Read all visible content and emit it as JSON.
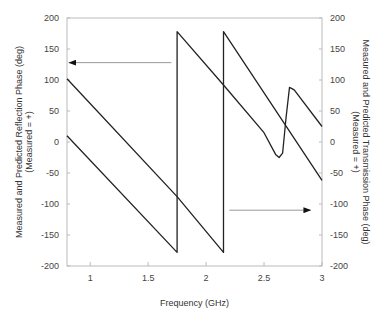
{
  "chart_data": {
    "type": "line",
    "title": "",
    "xlabel": "Frequency (GHz)",
    "ylabel_left": [
      "Measured and Predicted Reflection Phase (deg)",
      "(Measured = +)"
    ],
    "ylabel_right": [
      "Measured and Predicted Transmission Phase (deg)",
      "(Measured = +)"
    ],
    "xlim": [
      0.8,
      3
    ],
    "ylim": [
      -200,
      200
    ],
    "x_ticks": [
      "1",
      "1.5",
      "2",
      "2.5",
      "3"
    ],
    "x_tick_values": [
      1,
      1.5,
      2,
      2.5,
      3
    ],
    "y_ticks": [
      "200",
      "150",
      "100",
      "50",
      "0",
      "-50",
      "-100",
      "-150",
      "-200"
    ],
    "y_tick_values": [
      200,
      150,
      100,
      50,
      0,
      -50,
      -100,
      -150,
      -200
    ],
    "grid": false,
    "series": [
      {
        "name": "Reflection phase",
        "axis": "left",
        "points": [
          [
            0.8,
            10
          ],
          [
            1.75,
            -178
          ],
          [
            1.75,
            178
          ],
          [
            2.15,
            92
          ],
          [
            2.5,
            15
          ],
          [
            2.6,
            -20
          ],
          [
            2.63,
            -25
          ],
          [
            2.66,
            -18
          ],
          [
            2.69,
            40
          ],
          [
            2.72,
            88
          ],
          [
            2.76,
            84
          ],
          [
            3,
            25
          ]
        ]
      },
      {
        "name": "Transmission phase",
        "axis": "right",
        "points": [
          [
            0.8,
            102
          ],
          [
            1.75,
            -88
          ],
          [
            2.15,
            -178
          ],
          [
            2.15,
            178
          ],
          [
            3,
            -62
          ]
        ]
      }
    ],
    "annotations": [
      {
        "type": "arrow",
        "direction": "left",
        "from": [
          1.7,
          128
        ],
        "to": [
          0.82,
          128
        ],
        "meaning": "left axis"
      },
      {
        "type": "arrow",
        "direction": "right",
        "from": [
          2.2,
          -110
        ],
        "to": [
          2.9,
          -110
        ],
        "meaning": "right axis"
      }
    ]
  }
}
